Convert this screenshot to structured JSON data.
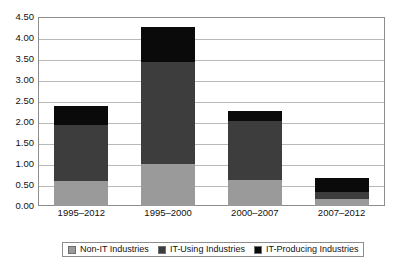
{
  "chart_data": {
    "type": "bar",
    "stacked": true,
    "title": "",
    "subtitle": "",
    "xlabel": "",
    "ylabel": "",
    "categories": [
      "1995–2012",
      "1995–2000",
      "2000–2007",
      "2007–2012"
    ],
    "series": [
      {
        "name": "Non-IT Industries",
        "color": "#9a9a9a",
        "values": [
          0.6,
          1.0,
          0.63,
          0.17
        ]
      },
      {
        "name": "IT-Using Industries",
        "color": "#3d3d3d",
        "values": [
          1.32,
          2.43,
          1.4,
          0.17
        ]
      },
      {
        "name": "IT-Producing Industries",
        "color": "#0a0a0a",
        "values": [
          0.47,
          0.83,
          0.24,
          0.32
        ]
      }
    ],
    "totals": [
      2.39,
      4.26,
      2.27,
      0.66
    ],
    "ylim": [
      0.0,
      4.5
    ],
    "ytick_values": [
      0.0,
      0.5,
      1.0,
      1.5,
      2.0,
      2.5,
      3.0,
      3.5,
      4.0,
      4.5
    ],
    "ytick_labels": [
      "0.00",
      "0.50",
      "1.00",
      "1.50",
      "2.00",
      "2.50",
      "3.00",
      "3.50",
      "4.00",
      "4.50"
    ],
    "grid": true,
    "grid_axis": "y",
    "legend_position": "bottom",
    "legend_entries": [
      "Non-IT Industries",
      "IT-Using Industries",
      "IT-Producing Industries"
    ],
    "annotations": []
  },
  "colors": {
    "non_it": "#9a9a9a",
    "it_using": "#3d3d3d",
    "it_producing": "#0a0a0a",
    "gridline": "#b9b9b9",
    "frame": "#8c8c8c",
    "text": "#111111",
    "background": "#ffffff"
  }
}
